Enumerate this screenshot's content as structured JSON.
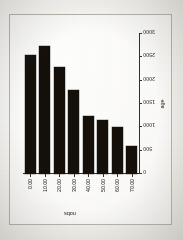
{
  "page": {
    "kind": "scanned-page-figure",
    "orientation": "figure printed rotated 90 degrees",
    "border_color": "#b9b5ad",
    "paper_color": "#f6f5f1",
    "ink_color": "#1a1410"
  },
  "chart_data": {
    "type": "bar",
    "orientation": "horizontal-on-page (rotated 90°)",
    "title": "",
    "xlabel": "age",
    "ylabel": "nobs",
    "categories": [
      "0.00",
      "10.00",
      "20.00",
      "30.00",
      "40.00",
      "50.00",
      "60.00",
      "70.00"
    ],
    "x_tick_labels": [
      "0.00",
      "10.00",
      "20.00",
      "30.00",
      "40.00",
      "50.00",
      "60.00",
      "70.00"
    ],
    "y_tick_labels": [
      "0",
      "500",
      "1000",
      "1500",
      "2000",
      "2500",
      "3000"
    ],
    "y_ticks": [
      0,
      500,
      1000,
      1500,
      2000,
      2500,
      3000
    ],
    "values": [
      2550,
      2750,
      2300,
      1800,
      1250,
      1150,
      1000,
      600
    ],
    "ylim": [
      0,
      3000
    ],
    "xlim": [
      0,
      75
    ],
    "grid": false,
    "legend": null,
    "bar_color": "#1a1410"
  }
}
